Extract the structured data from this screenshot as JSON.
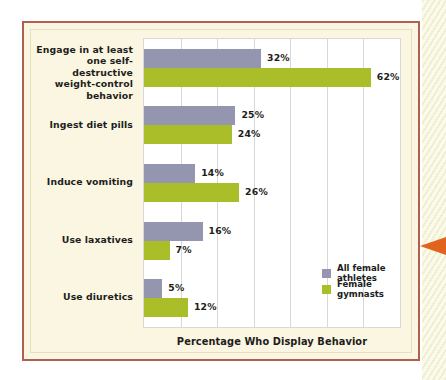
{
  "panel": {
    "border_color": "#b0604e",
    "background_color": "#faf6e2"
  },
  "decor": {
    "edge_strip_color": "#f2efcf",
    "arrow_color": "#e0641e",
    "arrow_name": "left-pointing-arrow"
  },
  "chart_data": {
    "type": "bar",
    "orientation": "horizontal",
    "title": "",
    "xlabel": "Percentage Who Display Behavior",
    "ylabel": "",
    "xlim": [
      0,
      70
    ],
    "xtick_step": 10,
    "grid": true,
    "legend_position": "inside-bottom-right",
    "categories": [
      "Engage in at least one self-destructive weight-control behavior",
      "Ingest diet pills",
      "Induce vomiting",
      "Use laxatives",
      "Use diuretics"
    ],
    "category_lines": [
      [
        "Engage in at least",
        "one self-destructive",
        "weight-control",
        "behavior"
      ],
      [
        "Ingest diet pills"
      ],
      [
        "Induce vomiting"
      ],
      [
        "Use laxatives"
      ],
      [
        "Use diuretics"
      ]
    ],
    "series": [
      {
        "name": "All female athletes",
        "color": "#9495ae",
        "values": [
          32,
          25,
          14,
          16,
          5
        ],
        "labels": [
          "32%",
          "25%",
          "14%",
          "16%",
          "5%"
        ]
      },
      {
        "name": "Female gymnasts",
        "color": "#aabe2a",
        "values": [
          62,
          24,
          26,
          7,
          12
        ],
        "labels": [
          "62%",
          "24%",
          "26%",
          "7%",
          "12%"
        ]
      }
    ]
  }
}
